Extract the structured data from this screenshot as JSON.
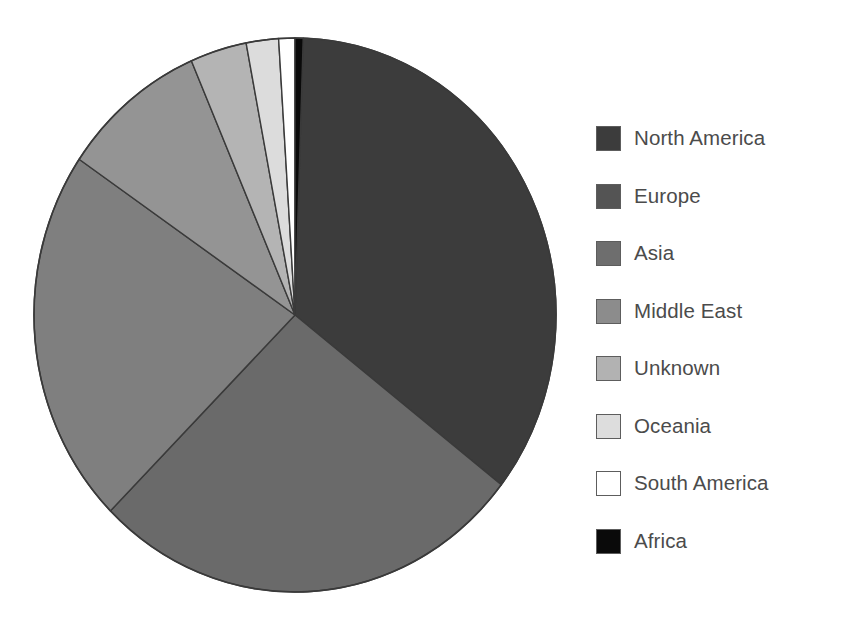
{
  "chart_data": {
    "type": "pie",
    "title": "",
    "subtitle": "",
    "xlabel": "",
    "ylabel": "",
    "grid": false,
    "legend_position": "right",
    "start_angle_deg": 0,
    "direction": "clockwise",
    "categories": [
      "North America",
      "Europe",
      "Asia",
      "Middle East",
      "Unknown",
      "Oceania",
      "South America",
      "Africa"
    ],
    "values": [
      35.0,
      27.0,
      22.0,
      9.0,
      3.5,
      2.0,
      1.0,
      0.5
    ],
    "slices": [
      {
        "label": "North America",
        "value": 35.0,
        "color": "#3c3c3c",
        "start_deg": 1.8,
        "end_deg": 127.8
      },
      {
        "label": "Europe",
        "value": 27.0,
        "color": "#6a6a6a",
        "start_deg": 127.8,
        "end_deg": 225.0
      },
      {
        "label": "Asia",
        "value": 22.0,
        "color": "#7f7f7f",
        "start_deg": 225.0,
        "end_deg": 304.2
      },
      {
        "label": "Middle East",
        "value": 9.0,
        "color": "#949494",
        "start_deg": 304.2,
        "end_deg": 336.6
      },
      {
        "label": "Unknown",
        "value": 3.5,
        "color": "#b4b4b4",
        "start_deg": 336.6,
        "end_deg": 349.2
      },
      {
        "label": "Oceania",
        "value": 2.0,
        "color": "#dcdcdc",
        "start_deg": 349.2,
        "end_deg": 356.4
      },
      {
        "label": "South America",
        "value": 1.0,
        "color": "#ffffff",
        "start_deg": 356.4,
        "end_deg": 360.0
      },
      {
        "label": "Africa",
        "value": 0.5,
        "color": "#0a0a0a",
        "start_deg": 360.0,
        "end_deg": 361.8
      }
    ]
  },
  "legend": {
    "items": [
      {
        "label": "North America",
        "color": "#3c3c3c"
      },
      {
        "label": "Europe",
        "color": "#545454"
      },
      {
        "label": "Asia",
        "color": "#6e6e6e"
      },
      {
        "label": "Middle East",
        "color": "#8c8c8c"
      },
      {
        "label": "Unknown",
        "color": "#b2b2b2"
      },
      {
        "label": "Oceania",
        "color": "#dddddd"
      },
      {
        "label": "South America",
        "color": "#ffffff"
      },
      {
        "label": "Africa",
        "color": "#0a0a0a"
      }
    ]
  },
  "geometry": {
    "center_x": 295,
    "center_y": 315,
    "radius_x": 261,
    "radius_y": 277,
    "outline_color": "#3a3a3a"
  }
}
